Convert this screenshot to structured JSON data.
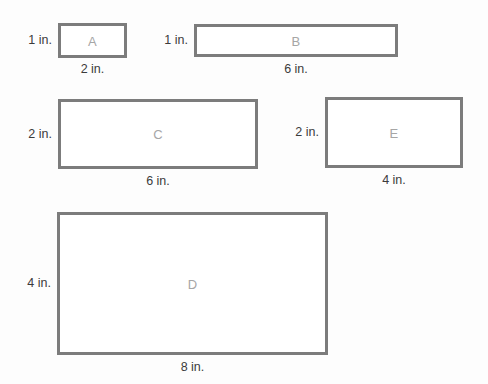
{
  "figure": {
    "unit": "in.",
    "background_color": "#fdfdfd",
    "border_color": "#7c7c7c",
    "letter_color": "#a6a6a6",
    "dimension_text_color": "#3b3b3b"
  },
  "rectangles": [
    {
      "name": "A",
      "letter": "A",
      "height_label": "1 in.",
      "width_label": "2 in.",
      "height_value": 1,
      "width_value": 2,
      "area": 2,
      "perimeter": 6
    },
    {
      "name": "B",
      "letter": "B",
      "height_label": "1 in.",
      "width_label": "6 in.",
      "height_value": 1,
      "width_value": 6,
      "area": 6,
      "perimeter": 14
    },
    {
      "name": "C",
      "letter": "C",
      "height_label": "2 in.",
      "width_label": "6 in.",
      "height_value": 2,
      "width_value": 6,
      "area": 12,
      "perimeter": 16
    },
    {
      "name": "E",
      "letter": "E",
      "height_label": "2 in.",
      "width_label": "4 in.",
      "height_value": 2,
      "width_value": 4,
      "area": 8,
      "perimeter": 12
    },
    {
      "name": "D",
      "letter": "D",
      "height_label": "4 in.",
      "width_label": "8 in.",
      "height_value": 4,
      "width_value": 8,
      "area": 32,
      "perimeter": 24
    }
  ]
}
